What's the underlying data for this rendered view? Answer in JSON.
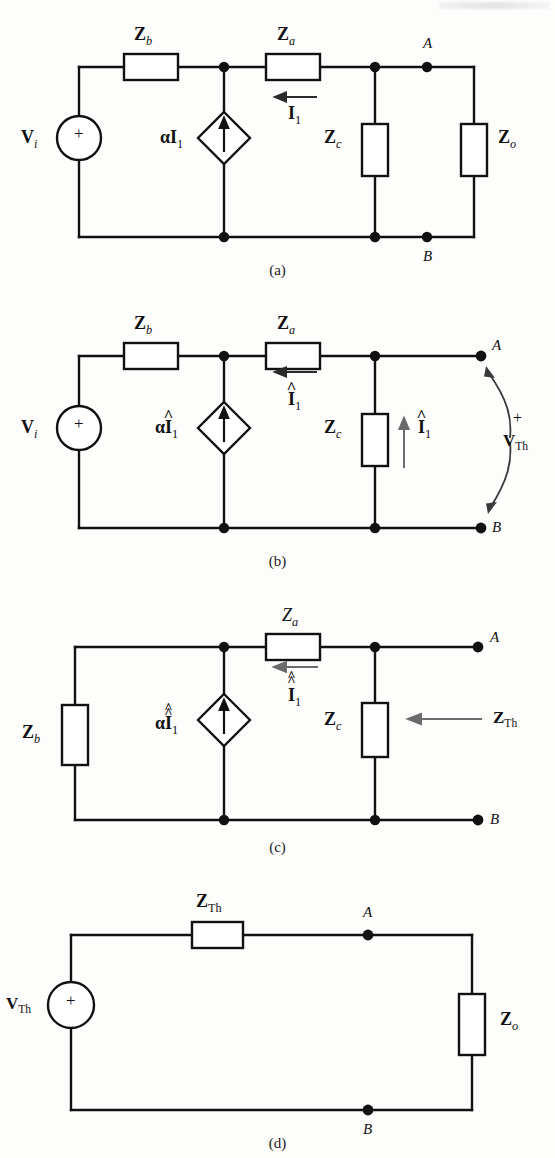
{
  "figure": {
    "kind": "circuit-diagram",
    "panel_count": 4,
    "background_hex": "#fdfdfc",
    "ink_hex": "#111111",
    "gray_arrow_hex": "#6b6b6b"
  },
  "panels": [
    {
      "id": "a",
      "caption": "(a)",
      "source_label": "V",
      "source_sub": "i",
      "source_polarity": "+",
      "dependent_source_label": "αI",
      "dependent_source_sub": "1",
      "dependent_source_hats": 0,
      "current_label": "I",
      "current_sub": "1",
      "current_hats": 0,
      "current_direction": "left",
      "elements": [
        {
          "name": "Zb",
          "label": "Z",
          "sub": "b",
          "orientation": "horizontal"
        },
        {
          "name": "Za",
          "label": "Z",
          "sub": "a",
          "orientation": "horizontal"
        },
        {
          "name": "Zc",
          "label": "Z",
          "sub": "c",
          "orientation": "vertical"
        },
        {
          "name": "Zo",
          "label": "Z",
          "sub": "o",
          "orientation": "vertical"
        }
      ],
      "terminals": [
        "A",
        "B"
      ]
    },
    {
      "id": "b",
      "caption": "(b)",
      "source_label": "V",
      "source_sub": "i",
      "source_polarity": "+",
      "dependent_source_label": "αI",
      "dependent_source_sub": "1",
      "dependent_source_hats": 1,
      "current_label": "I",
      "current_sub": "1",
      "current_hats": 1,
      "current_direction": "left",
      "branch_current_label": "I",
      "branch_current_sub": "1",
      "branch_current_hats": 1,
      "branch_current_direction": "up",
      "output_label": "V",
      "output_sub": "Th",
      "output_polarity": "+",
      "elements": [
        {
          "name": "Zb",
          "label": "Z",
          "sub": "b",
          "orientation": "horizontal"
        },
        {
          "name": "Za",
          "label": "Z",
          "sub": "a",
          "orientation": "horizontal"
        },
        {
          "name": "Zc",
          "label": "Z",
          "sub": "c",
          "orientation": "vertical"
        }
      ],
      "terminals": [
        "A",
        "B"
      ]
    },
    {
      "id": "c",
      "caption": "(c)",
      "dependent_source_label": "αI",
      "dependent_source_sub": "1",
      "dependent_source_hats": 2,
      "current_label": "I",
      "current_sub": "1",
      "current_hats": 2,
      "current_direction": "left",
      "impedance_label": "Z",
      "impedance_sub": "Th",
      "impedance_arrow_direction": "left",
      "elements": [
        {
          "name": "Zb",
          "label": "Z",
          "sub": "b",
          "orientation": "vertical"
        },
        {
          "name": "Za",
          "label": "Z",
          "sub": "a",
          "orientation": "horizontal"
        },
        {
          "name": "Zc",
          "label": "Z",
          "sub": "c",
          "orientation": "vertical"
        }
      ],
      "terminals": [
        "A",
        "B"
      ]
    },
    {
      "id": "d",
      "caption": "(d)",
      "source_label": "V",
      "source_sub": "Th",
      "source_polarity": "+",
      "elements": [
        {
          "name": "ZTh",
          "label": "Z",
          "sub": "Th",
          "orientation": "horizontal"
        },
        {
          "name": "Zo",
          "label": "Z",
          "sub": "o",
          "orientation": "vertical"
        }
      ],
      "terminals": [
        "A",
        "B"
      ]
    }
  ],
  "labels": {
    "Z": "Z",
    "V": "V",
    "I": "I",
    "alphaI": "αI",
    "sub_a": "a",
    "sub_b": "b",
    "sub_c": "c",
    "sub_o": "o",
    "sub_i": "i",
    "sub_1": "1",
    "sub_Th": "Th",
    "node_A": "A",
    "node_B": "B",
    "plus": "+",
    "hat": "^",
    "dblhat": "«",
    "cap_a": "(a)",
    "cap_b": "(b)",
    "cap_c": "(c)",
    "cap_d": "(d)"
  }
}
